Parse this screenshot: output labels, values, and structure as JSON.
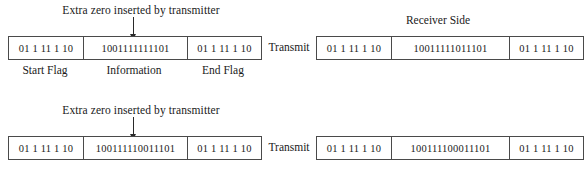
{
  "rows": [
    {
      "annotation": "Extra zero inserted by transmitter",
      "transmit_label": "Transmit",
      "receiver_heading": "Receiver Side",
      "transmitter_frame": {
        "start_flag": "01 1 11 1 10",
        "information": "1001111111101",
        "end_flag": "01 1 11 1 10"
      },
      "field_labels": {
        "start": "Start Flag",
        "information": "Information",
        "end": "End Flag"
      },
      "receiver_frame": {
        "start_flag": "01 1 11 1 10",
        "information": "10011111011101",
        "end_flag": "01 1 11 1 10"
      }
    },
    {
      "annotation": "Extra zero inserted by transmitter",
      "transmit_label": "Transmit",
      "receiver_heading": "",
      "transmitter_frame": {
        "start_flag": "01 1 11 1 10",
        "information": "100111110011101",
        "end_flag": "01 1 11 1 10"
      },
      "field_labels": {
        "start": "",
        "information": "",
        "end": ""
      },
      "receiver_frame": {
        "start_flag": "01 1 11 1 10",
        "information": "100111100011101",
        "end_flag": "01 1 11 1 10"
      }
    }
  ],
  "colors": {
    "background": "#ffffff",
    "border": "#4a4a4a",
    "text": "#1a1a1a",
    "arrow": "#2a2a2a"
  }
}
